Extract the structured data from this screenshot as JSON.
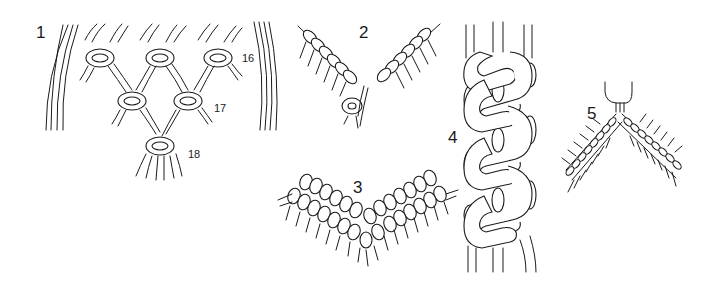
{
  "figures": [
    {
      "id": "1",
      "label": "1",
      "description": "Square knot network (alternating square knots forming a V)",
      "callouts": [
        "16",
        "17",
        "18"
      ]
    },
    {
      "id": "2",
      "label": "2",
      "description": "Two diagonal half-hitch bars meeting in a V, joined by a knot"
    },
    {
      "id": "3",
      "label": "3",
      "description": "Double rows of diagonal half hitches forming a V"
    },
    {
      "id": "4",
      "label": "4",
      "description": "Vertical chain of interlocking alternating knots (sennit)"
    },
    {
      "id": "5",
      "label": "5",
      "description": "Inverted V of diagonal half-hitch bars hung from a loop"
    }
  ],
  "colors": {
    "line": "#1a1a1a",
    "background": "#ffffff"
  }
}
